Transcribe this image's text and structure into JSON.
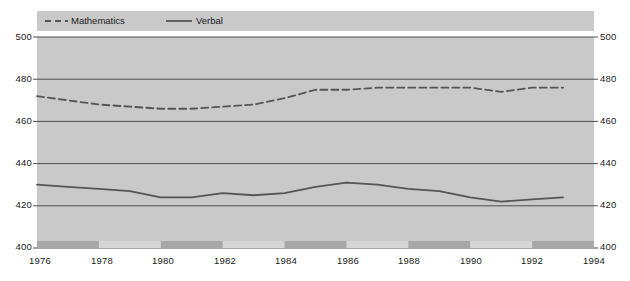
{
  "chart_data": {
    "type": "line",
    "title": "",
    "subtitle": "",
    "xlabel": "",
    "ylabel": "",
    "xlim": [
      1976,
      1994
    ],
    "ylim": [
      400,
      500
    ],
    "x_ticks": [
      1976,
      1978,
      1980,
      1982,
      1984,
      1986,
      1988,
      1990,
      1992,
      1994
    ],
    "y_ticks": [
      400,
      420,
      440,
      460,
      480,
      500
    ],
    "grid": "horizontal",
    "legend_position": "top-left",
    "x": [
      1976,
      1977,
      1978,
      1979,
      1980,
      1981,
      1982,
      1983,
      1984,
      1985,
      1986,
      1987,
      1988,
      1989,
      1990,
      1991,
      1992,
      1993
    ],
    "series": [
      {
        "name": "Mathematics",
        "style": "dashed",
        "color": "#555555",
        "values": [
          472,
          470,
          468,
          467,
          466,
          466,
          467,
          468,
          471,
          475,
          475,
          476,
          476,
          476,
          476,
          474,
          476,
          476
        ]
      },
      {
        "name": "Verbal",
        "style": "solid",
        "color": "#555555",
        "values": [
          430,
          429,
          428,
          427,
          424,
          424,
          426,
          425,
          426,
          429,
          431,
          430,
          428,
          427,
          424,
          422,
          423,
          424
        ]
      }
    ],
    "shaded_bands": [
      {
        "start": 1976,
        "end": 1978
      },
      {
        "start": 1980,
        "end": 1982
      },
      {
        "start": 1984,
        "end": 1986
      },
      {
        "start": 1988,
        "end": 1990
      },
      {
        "start": 1992,
        "end": 1994
      }
    ]
  },
  "legend": {
    "items": [
      {
        "label": "Mathematics",
        "marker": "dashed-line-swatch"
      },
      {
        "label": "Verbal",
        "marker": "solid-line-swatch"
      }
    ]
  },
  "y_axis_left": {
    "ticks": [
      "500",
      "480",
      "460",
      "440",
      "420",
      "400"
    ]
  },
  "y_axis_right": {
    "ticks": [
      "500",
      "480",
      "460",
      "440",
      "420",
      "400"
    ]
  },
  "x_axis": {
    "ticks": [
      "1976",
      "1978",
      "1980",
      "1982",
      "1984",
      "1986",
      "1988",
      "1990",
      "1992",
      "1994"
    ]
  },
  "colors": {
    "plot_background": "#c9c9c9",
    "legend_background": "#c9c9c9",
    "band_light": "#d6d6d6",
    "band_dark": "#a8a8a8",
    "gridline": "#4d4d4d",
    "line": "#555555",
    "text": "#1a1a1a"
  }
}
